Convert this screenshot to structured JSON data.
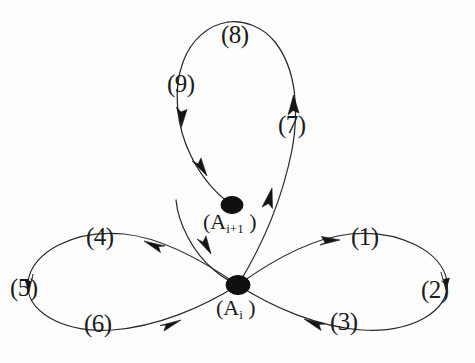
{
  "figure": {
    "background_color": "#fdfdfd",
    "stroke_color": "#2a2a2a",
    "node_color": "#101010",
    "nodes": [
      {
        "id": "node-upper",
        "label": "(A",
        "subscript": "i+1",
        "label_tail": " )",
        "cx": 232,
        "cy": 205,
        "rx": 11,
        "ry": 8
      },
      {
        "id": "node-lower",
        "label": "(A",
        "subscript": "i",
        "label_tail": " )",
        "cx": 238,
        "cy": 285,
        "rx": 12,
        "ry": 9
      }
    ],
    "edge_labels": [
      {
        "id": "label-1",
        "text": "(1)",
        "x": 351,
        "y": 224
      },
      {
        "id": "label-2",
        "text": "(2)",
        "x": 421,
        "y": 277
      },
      {
        "id": "label-3",
        "text": "(3)",
        "x": 330,
        "y": 309
      },
      {
        "id": "label-4",
        "text": "(4)",
        "x": 86,
        "y": 224
      },
      {
        "id": "label-5",
        "text": "(5)",
        "x": 10,
        "y": 275
      },
      {
        "id": "label-6",
        "text": "(6)",
        "x": 84,
        "y": 311
      },
      {
        "id": "label-7",
        "text": "(7)",
        "x": 278,
        "y": 112
      },
      {
        "id": "label-8",
        "text": "(8)",
        "x": 221,
        "y": 22
      },
      {
        "id": "label-9",
        "text": "(9)",
        "x": 167,
        "y": 71
      }
    ],
    "arrow_directions": {
      "segment-1": "right",
      "segment-3": "left",
      "segment-4": "left",
      "segment-6": "right",
      "segment-7": "up",
      "segment-9-upper": "down",
      "segment-9-lower": "down-right",
      "segment-incoming-tail": "down-right"
    }
  }
}
